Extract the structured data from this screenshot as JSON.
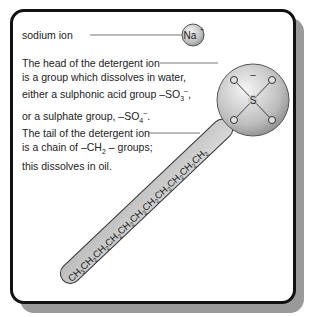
{
  "labels": {
    "sodium": "sodium ion",
    "head_line1": "The head of the detergent ion",
    "head_line2": "is a group which dissolves in water,",
    "head_line3": "either a sulphonic acid group –SO",
    "head_line3_sub": "3",
    "head_line3_sup": "–",
    "head_line4": "or a sulphate group, –SO",
    "head_line4_sub": "4",
    "head_line4_sup": "–",
    "tail_line1": "The tail of the detergent ion",
    "tail_line2a": "is a chain of –CH",
    "tail_line2_sub": "2",
    "tail_line2b": " – groups;",
    "tail_line3": "this dissolves in oil."
  },
  "molecule": {
    "sodium_symbol": "Na",
    "sodium_charge": "+",
    "head_atoms": {
      "center": "S",
      "oxygens": [
        "O",
        "O",
        "O",
        "O"
      ],
      "charge": "–"
    },
    "tail_text": "CH3CH2CH2CH2CH2CH2CH2CH2CH2CH2CH2"
  }
}
